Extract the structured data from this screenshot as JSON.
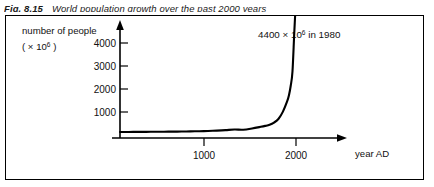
{
  "caption": {
    "figure_number": "Fig. 8.15",
    "title": "World population growth over the past 2000 years"
  },
  "chart_data": {
    "type": "line",
    "title": "World population growth over the past 2000 years",
    "xlabel": "year AD",
    "ylabel_line1": "number of people",
    "ylabel_line2": "( × 10⁶ )",
    "ylabel_prefix": "( × 10",
    "ylabel_exponent": "6",
    "ylabel_suffix": " )",
    "xlim": [
      0,
      2100
    ],
    "ylim": [
      0,
      4600
    ],
    "xticks": [
      1000,
      2000
    ],
    "xtick_labels": [
      "1000",
      "2000"
    ],
    "yticks": [
      1000,
      2000,
      3000,
      4000
    ],
    "ytick_labels": [
      "1000",
      "2000",
      "3000",
      "4000"
    ],
    "grid": false,
    "legend": null,
    "annotations": [
      {
        "text": "4400 × 10⁶ in 1980",
        "prefix": "4400 × 10",
        "exponent": "6",
        "suffix": " in 1980",
        "x": 1980,
        "y": 4400
      }
    ],
    "series": [
      {
        "name": "world population",
        "x": [
          0,
          100,
          200,
          300,
          400,
          500,
          600,
          700,
          800,
          900,
          1000,
          1100,
          1200,
          1300,
          1400,
          1500,
          1600,
          1650,
          1700,
          1750,
          1800,
          1850,
          1900,
          1920,
          1940,
          1960,
          1980,
          2000,
          2030
        ],
        "values": [
          250,
          255,
          258,
          260,
          262,
          265,
          268,
          272,
          278,
          285,
          295,
          310,
          330,
          355,
          350,
          400,
          470,
          510,
          560,
          650,
          800,
          1100,
          1550,
          1800,
          2200,
          2800,
          4400,
          6000,
          9200
        ]
      }
    ]
  },
  "axis_marks": {
    "y_axis_arrow": "arrow-up",
    "x_axis_arrow": "arrow-right"
  }
}
